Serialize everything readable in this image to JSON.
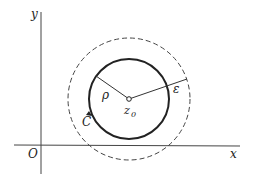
{
  "diagram": {
    "axes": {
      "x_label": "x",
      "y_label": "y",
      "origin_label": "O"
    },
    "labels": {
      "center": "z",
      "center_sub": "0",
      "rho": "ρ",
      "epsilon": "ε",
      "contour": "C"
    },
    "colors": {
      "stroke": "#222222",
      "background": "#ffffff"
    }
  }
}
